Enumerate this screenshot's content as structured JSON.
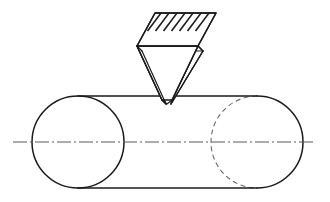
{
  "figure": {
    "background_color": "#ffffff",
    "line_color": "#1a1a1a",
    "hidden_line_color": "#6b6b6b",
    "center_line_color": "#5a5a5a",
    "width": 330,
    "height": 202
  },
  "cylinder": {
    "label": "cylindrical-workpiece",
    "axis_y": 142,
    "radius": 46,
    "top_line_y": 96,
    "bottom_line_y": 188,
    "left_end_center_x": 78,
    "right_end_center_x": 257,
    "left_ellipse_rx": 46,
    "left_ellipse_ry": 46,
    "right_ellipse_rx": 46,
    "right_ellipse_ry": 46,
    "hidden_arc_visible": true,
    "top_line": "M 78 96 L 257 96",
    "bottom_line": "M 78 188 L 257 188",
    "left_ellipse": "M 78 96 A 46 46 0 1 0 78 188 A 46 46 0 1 0 78 96",
    "right_cap_arc": "M 257 96 A 46 46 0 0 1 257 188",
    "right_hidden_arc": "M 257 96 A 46 46 0 0 0 257 188"
  },
  "center_line": {
    "label": "axis-center-line",
    "style": "dash-dot",
    "x_start": 13,
    "x_end": 315,
    "y": 142,
    "path": "M 13 142 L 315 142"
  },
  "tool": {
    "label": "knurling-wedge-tool",
    "top_face": {
      "label": "hatched-top-face",
      "points": "155,13 216,13 198,46 137,46",
      "hatch_count": 7,
      "hatch_angle": "diagonal"
    },
    "hatch_lines": [
      "M 147.5 31 L 161 13",
      "M 155.5 31 L 169 13",
      "M 163.5 31 L 177 13",
      "M 171.5 31 L 185 13",
      "M 179.5 31 L 193 13",
      "M 187.5 31 L 201 13",
      "M 195.5 31 L 209 13"
    ],
    "hatch_band": {
      "clip_points": "155,13 216,13 198,46 137,46"
    },
    "front_face": {
      "label": "front-triangular-face",
      "points": "137,46 198,46 172,100 162,100"
    },
    "left_side_face": {
      "label": "left-side-face",
      "points": "137,46 142,51 166,104 162,100"
    },
    "tip": {
      "label": "tool-tip",
      "apex_x": 167,
      "apex_y": 104,
      "contact_y": 96,
      "penetration_depth": 8,
      "tip_outline": "M 162 100 L 167 104 L 172 100"
    },
    "body_edges": [
      "M 137 46 L 162 100",
      "M 198 46 L 172 100",
      "M 142 51 L 166 104",
      "M 203 51 L 171 104",
      "M 137 46 L 142 51",
      "M 198 46 L 203 51",
      "M 162 100 L 166 104",
      "M 172 100 L 171 104"
    ],
    "back_lower_edge": "M 142 51 L 203 51"
  }
}
